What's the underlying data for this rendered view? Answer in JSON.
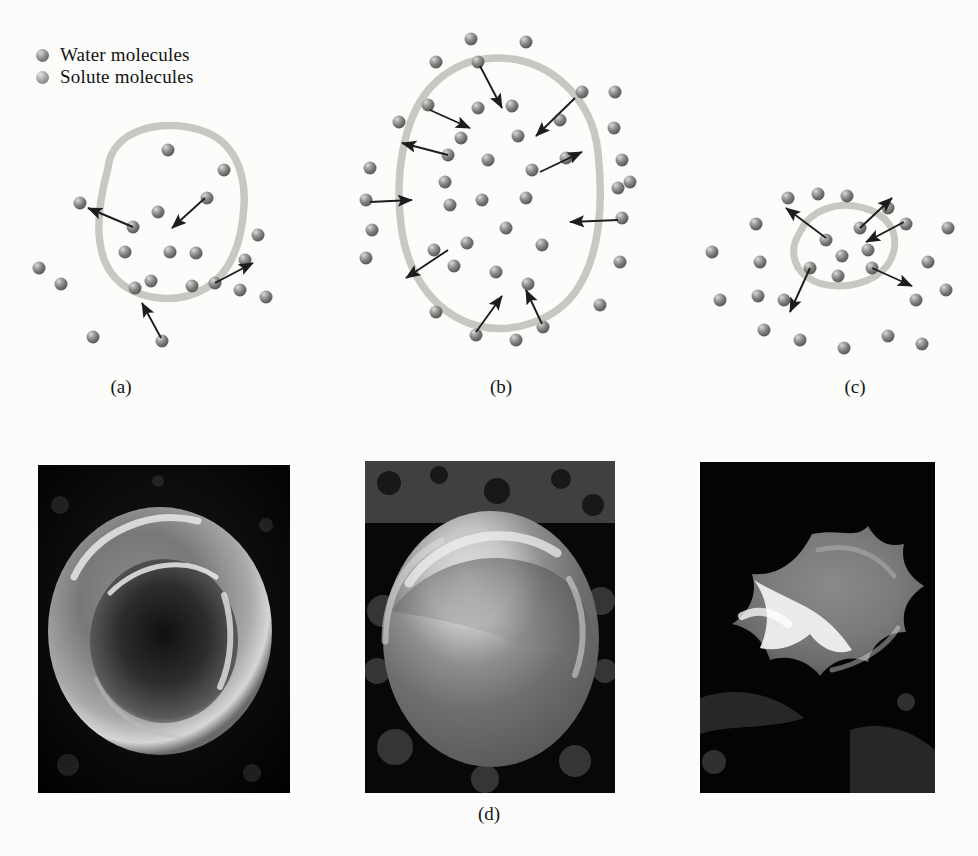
{
  "figure": {
    "background_color": "#fcfcfb"
  },
  "legend": {
    "items": [
      {
        "label": "Water molecules",
        "marker": "water-sphere-icon",
        "color": "#7b7b79"
      },
      {
        "label": "Solute molecules",
        "marker": "solute-sphere-icon",
        "color": "#8f8f8d"
      }
    ]
  },
  "panels": [
    {
      "id": "a",
      "caption": "(a)",
      "condition": "isotonic",
      "description": "Cell in isotonic solution: water moves in and out at equal rates; cell keeps normal shape",
      "membrane_color": "#c9c7c1",
      "arrow_color": "#1d1d1d",
      "cell": {
        "cx": 165,
        "cy": 230,
        "rx": 78,
        "ry": 80
      },
      "molecules_inside": 9,
      "molecules_outside": 12,
      "arrows_in": 2,
      "arrows_out": 2
    },
    {
      "id": "b",
      "caption": "(b)",
      "condition": "hypotonic",
      "description": "Cell in hypotonic solution: net water movement into the cell; cell swells and may burst",
      "membrane_color": "#c9c7c1",
      "arrow_color": "#1d1d1d",
      "cell": {
        "cx": 168,
        "cy": 195,
        "rx": 100,
        "ry": 120
      },
      "molecules_inside": 19,
      "molecules_outside": 24,
      "arrows_in": 6,
      "arrows_out": 3
    },
    {
      "id": "c",
      "caption": "(c)",
      "condition": "hypertonic",
      "description": "Cell in hypertonic solution: net water movement out of the cell; cell shrinks and crenates",
      "membrane_color": "#c9c7c1",
      "arrow_color": "#1d1d1d",
      "cell": {
        "cx": 178,
        "cy": 112,
        "rx": 46,
        "ry": 34
      },
      "molecules_inside": 7,
      "molecules_outside": 20,
      "arrows_in": 2,
      "arrows_out": 3
    }
  ],
  "micrographs": {
    "caption": "(d)",
    "images": [
      {
        "id": "micro-1",
        "alt": "Scanning electron micrograph of a normal biconcave red blood cell in isotonic solution",
        "shape": "biconcave-disc"
      },
      {
        "id": "micro-2",
        "alt": "Scanning electron micrograph of a swollen spherical red blood cell in hypotonic solution",
        "shape": "swollen-sphere"
      },
      {
        "id": "micro-3",
        "alt": "Scanning electron micrograph of a shrunken crenated red blood cell in hypertonic solution",
        "shape": "crenated-spiky"
      }
    ]
  }
}
